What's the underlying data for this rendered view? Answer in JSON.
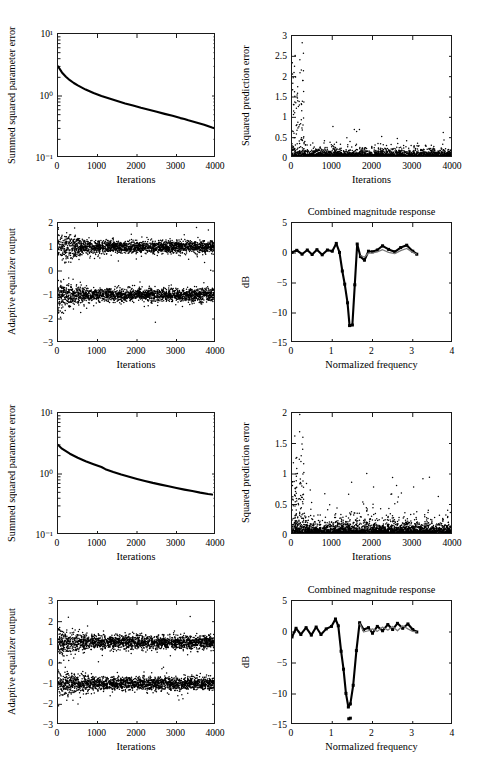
{
  "figure": {
    "kind": "multi-panel-figure",
    "rows": 4,
    "cols": 2,
    "background": "#ffffff",
    "foreground": "#000000"
  },
  "chart_data": [
    {
      "id": "panel-r1c1",
      "type": "line",
      "title": "",
      "xlabel": "Iterations",
      "ylabel": "Summed squared parameter error",
      "yscale": "log",
      "xlim": [
        0,
        4000
      ],
      "ylim": [
        0.1,
        10
      ],
      "xticks": [
        0,
        1000,
        2000,
        3000,
        4000
      ],
      "xticklabels": [
        "0",
        "1000",
        "2000",
        "3000",
        "4000"
      ],
      "yticks": [
        0.1,
        1,
        10
      ],
      "yticklabels": [
        "10⁻¹",
        "10⁰",
        "10¹"
      ],
      "grid": false,
      "series": [
        {
          "name": "summed squared parameter error",
          "x": [
            0,
            100,
            200,
            300,
            400,
            500,
            700,
            900,
            1100,
            1300,
            1500,
            1700,
            1800,
            1900,
            2100,
            2300,
            2500,
            2700,
            2900,
            3100,
            3200,
            3300,
            3500,
            3700,
            3900,
            4000
          ],
          "y": [
            3.0,
            2.4,
            2.05,
            1.8,
            1.62,
            1.48,
            1.27,
            1.12,
            1.0,
            0.91,
            0.83,
            0.76,
            0.73,
            0.7,
            0.645,
            0.6,
            0.555,
            0.515,
            0.48,
            0.44,
            0.425,
            0.405,
            0.375,
            0.345,
            0.31,
            0.295
          ]
        }
      ]
    },
    {
      "id": "panel-r1c2",
      "type": "scatter",
      "title": "",
      "xlabel": "Iterations",
      "ylabel": "Squared prediction error",
      "xlim": [
        0,
        4000
      ],
      "ylim": [
        0,
        3
      ],
      "xticks": [
        0,
        1000,
        2000,
        3000,
        4000
      ],
      "xticklabels": [
        "0",
        "1000",
        "2000",
        "3000",
        "4000"
      ],
      "yticks": [
        0,
        0.5,
        1,
        1.5,
        2,
        2.5,
        3
      ],
      "yticklabels": [
        "0",
        "0.5",
        "1",
        "1.5",
        "2",
        "2.5",
        "3"
      ],
      "grid": false,
      "description": "dense cloud of squared prediction errors concentrated below 0.3 across all iterations, with a dense burst of large values up to 3 during the first ~300 iterations and scattered outliers up to ~1.0 thereafter",
      "n_points": 4000,
      "baseline_level": 0.12,
      "initial_transient_max": 3.0,
      "steady_outlier_max": 1.0
    },
    {
      "id": "panel-r2c1",
      "type": "scatter",
      "title": "",
      "xlabel": "Iterations",
      "ylabel": "Adaptive equalizer output",
      "xlim": [
        0,
        4000
      ],
      "ylim": [
        -3,
        2
      ],
      "xticks": [
        0,
        1000,
        2000,
        3000,
        4000
      ],
      "xticklabels": [
        "0",
        "1000",
        "2000",
        "3000",
        "4000"
      ],
      "yticks": [
        -3,
        -2,
        -1,
        0,
        1,
        2
      ],
      "yticklabels": [
        "−3",
        "−2",
        "−1",
        "0",
        "1",
        "2"
      ],
      "grid": false,
      "description": "two dense horizontal bands of equalizer outputs centered near +1 and −1 representing binary symbols, spread widest at the start and tightening as the equalizer converges",
      "n_points": 4000,
      "cluster_centers": [
        1,
        -1
      ],
      "cluster_spread_initial": 0.55,
      "cluster_spread_final": 0.25
    },
    {
      "id": "panel-r2c2",
      "type": "line",
      "title": "Combined magnitude response",
      "xlabel": "Normalized frequency",
      "ylabel": "dB",
      "xlim": [
        0,
        4
      ],
      "ylim": [
        -15,
        5
      ],
      "xticks": [
        0,
        1,
        2,
        3,
        4
      ],
      "xticklabels": [
        "0",
        "1",
        "2",
        "3",
        "4"
      ],
      "yticks": [
        -15,
        -10,
        -5,
        0,
        5
      ],
      "yticklabels": [
        "−15",
        "−10",
        "−5",
        "0",
        "5"
      ],
      "grid": false,
      "series": [
        {
          "name": "combined response (markers)",
          "style": "thick-with-square-markers",
          "x": [
            0.0,
            0.12,
            0.25,
            0.38,
            0.5,
            0.62,
            0.75,
            0.88,
            1.0,
            1.1,
            1.18,
            1.25,
            1.31,
            1.38,
            1.43,
            1.5,
            1.56,
            1.62,
            1.7,
            1.8,
            1.9,
            2.0,
            2.12,
            2.25,
            2.4,
            2.55,
            2.7,
            2.85,
            3.0,
            3.1
          ],
          "y": [
            0.1,
            0.45,
            -0.2,
            0.5,
            -0.25,
            0.55,
            -0.3,
            0.5,
            0.3,
            1.6,
            0.1,
            -3.0,
            -5.2,
            -8.3,
            -12.1,
            -12.0,
            -5.3,
            1.5,
            -0.6,
            -1.2,
            0.3,
            0.2,
            0.5,
            1.2,
            0.6,
            0.2,
            0.9,
            1.3,
            0.3,
            -0.2
          ]
        },
        {
          "name": "reference response",
          "style": "thin-gray",
          "x": [
            1.7,
            1.8,
            1.9,
            2.0,
            2.12,
            2.25,
            2.4,
            2.55,
            2.7,
            2.85,
            3.0,
            3.1
          ],
          "y": [
            -0.4,
            -0.7,
            0.0,
            0.0,
            0.2,
            0.55,
            0.1,
            -0.1,
            0.4,
            0.75,
            0.1,
            -0.2
          ]
        }
      ]
    },
    {
      "id": "panel-r3c1",
      "type": "line",
      "title": "",
      "xlabel": "Iterations",
      "ylabel": "Summed squared parameter error",
      "yscale": "log",
      "xlim": [
        0,
        4000
      ],
      "ylim": [
        0.1,
        10
      ],
      "xticks": [
        0,
        1000,
        2000,
        3000,
        4000
      ],
      "xticklabels": [
        "0",
        "1000",
        "2000",
        "3000",
        "4000"
      ],
      "yticks": [
        0.1,
        1,
        10
      ],
      "yticklabels": [
        "10⁻¹",
        "10⁰",
        "10¹"
      ],
      "grid": false,
      "series": [
        {
          "name": "summed squared parameter error",
          "x": [
            0,
            100,
            300,
            500,
            700,
            900,
            1100,
            1200,
            1400,
            1600,
            1800,
            2000,
            2200,
            2400,
            2600,
            2800,
            3000,
            3200,
            3400,
            3600,
            3800,
            3900
          ],
          "y": [
            3.0,
            2.6,
            2.15,
            1.85,
            1.62,
            1.45,
            1.3,
            1.2,
            1.08,
            0.98,
            0.9,
            0.83,
            0.77,
            0.715,
            0.67,
            0.63,
            0.59,
            0.555,
            0.525,
            0.495,
            0.47,
            0.46
          ]
        }
      ]
    },
    {
      "id": "panel-r3c2",
      "type": "scatter",
      "title": "",
      "xlabel": "Iterations",
      "ylabel": "Squared prediction error",
      "xlim": [
        0,
        4000
      ],
      "ylim": [
        0,
        2
      ],
      "xticks": [
        0,
        1000,
        2000,
        3000,
        4000
      ],
      "xticklabels": [
        "0",
        "1000",
        "2000",
        "3000",
        "4000"
      ],
      "yticks": [
        0,
        0.5,
        1,
        1.5,
        2
      ],
      "yticklabels": [
        "0",
        "0.5",
        "1",
        "1.5",
        "2"
      ],
      "grid": false,
      "description": "dense cloud of squared prediction errors below ~0.3 with a short initial transient reaching 1.75 and isolated outliers near 1.45 at iteration 1000 and 0.8 at iteration 2500",
      "n_points": 4000,
      "baseline_level": 0.13,
      "initial_transient_max": 1.78,
      "steady_outlier_max": 1.45
    },
    {
      "id": "panel-r4c1",
      "type": "scatter",
      "title": "",
      "xlabel": "Iterations",
      "ylabel": "Adaptive equalizer output",
      "xlim": [
        0,
        4000
      ],
      "ylim": [
        -3,
        3
      ],
      "xticks": [
        0,
        1000,
        2000,
        3000,
        4000
      ],
      "xticklabels": [
        "0",
        "1000",
        "2000",
        "3000",
        "4000"
      ],
      "yticks": [
        -3,
        -2,
        -1,
        0,
        1,
        2,
        3
      ],
      "yticklabels": [
        "−3",
        "−2",
        "−1",
        "0",
        "1",
        "2",
        "3"
      ],
      "grid": false,
      "description": "two dense horizontal bands of equalizer outputs centered near +1 and −1, wider initial spread that narrows after convergence",
      "n_points": 4000,
      "cluster_centers": [
        1,
        -1
      ],
      "cluster_spread_initial": 0.6,
      "cluster_spread_final": 0.3
    },
    {
      "id": "panel-r4c2",
      "type": "line",
      "title": "Combined magnitude response",
      "xlabel": "Normalized frequency",
      "ylabel": "dB",
      "xlim": [
        0,
        4
      ],
      "ylim": [
        -15,
        5
      ],
      "xticks": [
        0,
        1,
        2,
        3,
        4
      ],
      "xticklabels": [
        "0",
        "1",
        "2",
        "3",
        "4"
      ],
      "yticks": [
        -15,
        -10,
        -5,
        0,
        5
      ],
      "yticklabels": [
        "−15",
        "−10",
        "−5",
        "0",
        "5"
      ],
      "grid": false,
      "series": [
        {
          "name": "combined response (markers)",
          "style": "thick-with-square-markers",
          "x": [
            0.0,
            0.1,
            0.22,
            0.35,
            0.48,
            0.6,
            0.72,
            0.85,
            0.98,
            1.08,
            1.15,
            1.22,
            1.28,
            1.34,
            1.4,
            1.45,
            1.52,
            1.6,
            1.68,
            1.78,
            1.9,
            2.0,
            2.12,
            2.25,
            2.38,
            2.5,
            2.62,
            2.75,
            2.88,
            3.0,
            3.1
          ],
          "y": [
            -0.8,
            0.6,
            -0.4,
            0.7,
            -0.5,
            0.8,
            -0.4,
            0.5,
            0.9,
            2.1,
            1.0,
            -3.1,
            -6.0,
            -9.9,
            -12.1,
            -11.6,
            -8.6,
            -3.0,
            1.5,
            0.4,
            0.7,
            -0.2,
            0.9,
            0.2,
            1.2,
            0.4,
            1.4,
            0.6,
            1.3,
            0.4,
            0.0
          ]
        },
        {
          "name": "reference response",
          "style": "thin-gray",
          "x": [
            1.68,
            1.78,
            1.9,
            2.0,
            2.12,
            2.25,
            2.38,
            2.5,
            2.62,
            2.75,
            2.88,
            3.0,
            3.1
          ],
          "y": [
            1.4,
            0.0,
            0.2,
            0.5,
            0.1,
            0.8,
            0.3,
            0.9,
            0.2,
            1.0,
            0.5,
            0.1,
            0.0
          ]
        }
      ],
      "extra_markers": [
        {
          "x": 1.41,
          "y": -14.0
        },
        {
          "x": 1.45,
          "y": -13.9
        }
      ]
    }
  ]
}
